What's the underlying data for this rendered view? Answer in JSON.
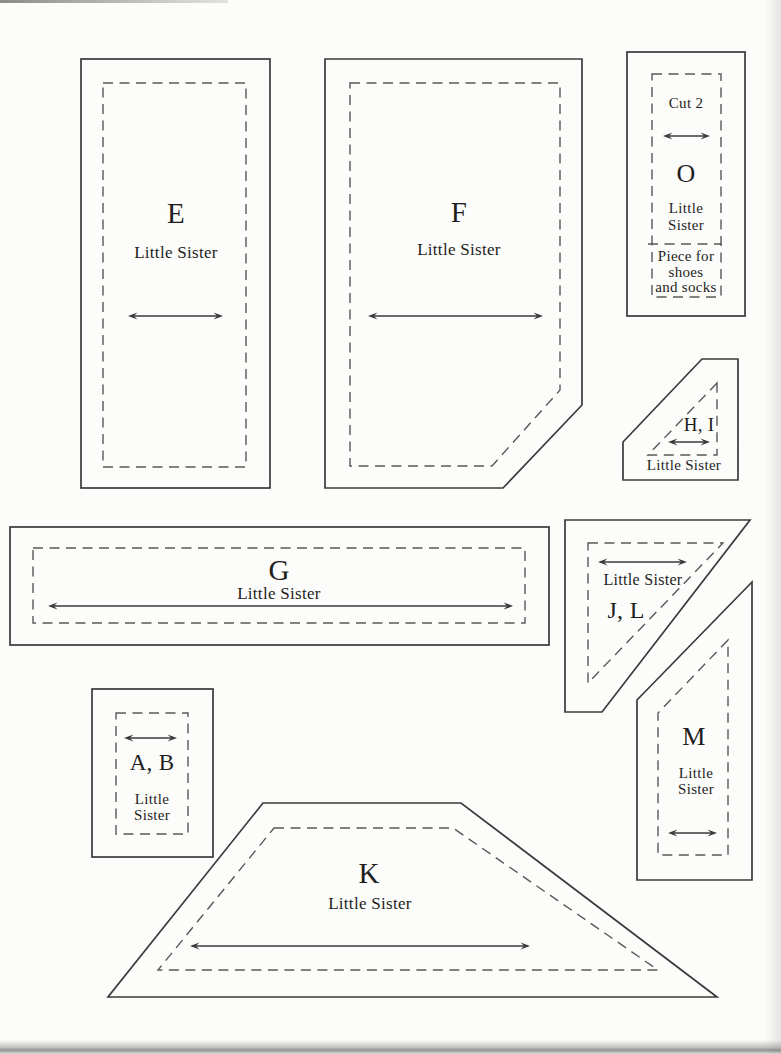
{
  "colors": {
    "paper": "#fcfcfa",
    "cutting_line": "#3a3a3a",
    "seam_line_dashed": "#585858",
    "text": "#1e1e1e",
    "page_edge_shadow": "#8c8c8a"
  },
  "pieces": {
    "E": {
      "label": "E",
      "name": "Little Sister"
    },
    "F": {
      "label": "F",
      "name": "Little Sister"
    },
    "O": {
      "cut_note": "Cut 2",
      "label": "O",
      "name_line1": "Little",
      "name_line2": "Sister",
      "usage_line1": "Piece for",
      "usage_line2": "shoes",
      "usage_line3": "and socks"
    },
    "HI": {
      "label": "H, I",
      "name": "Little Sister"
    },
    "G": {
      "label": "G",
      "name": "Little Sister"
    },
    "JL": {
      "label": "J, L",
      "name": "Little Sister"
    },
    "AB": {
      "label": "A, B",
      "name_line1": "Little",
      "name_line2": "Sister"
    },
    "M": {
      "label": "M",
      "name_line1": "Little",
      "name_line2": "Sister"
    },
    "K": {
      "label": "K",
      "name": "Little Sister"
    }
  }
}
